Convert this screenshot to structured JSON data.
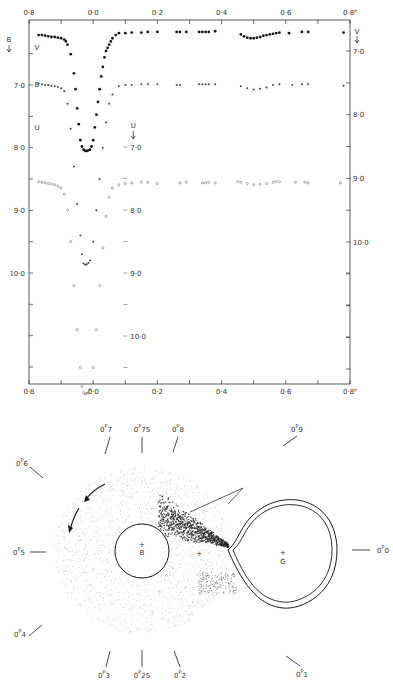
{
  "chart_data": [
    {
      "type": "scatter",
      "title": "",
      "xlabel": "Phase",
      "ylabel": "Magnitude",
      "x_ticks": [
        "0·8",
        "0·0",
        "0·2",
        "0·4",
        "0·6",
        "0·8ᴾ"
      ],
      "x_tick_values": [
        -0.2,
        0.0,
        0.2,
        0.4,
        0.6,
        0.8
      ],
      "xlim": [
        -0.2,
        0.8
      ],
      "axes": {
        "left_B": {
          "label": "B",
          "ticks": [
            "7·0",
            "8·0",
            "9·0",
            "10·0"
          ],
          "values": [
            7.0,
            8.0,
            9.0,
            10.0
          ],
          "ylim": [
            6.4,
            11.8
          ]
        },
        "right_V": {
          "label": "V",
          "ticks": [
            "7·0",
            "8·0",
            "9·0",
            "10·0"
          ],
          "values": [
            7.0,
            8.0,
            9.0,
            10.0
          ],
          "ylim": [
            6.5,
            11.8
          ]
        },
        "inner_U": {
          "label": "U",
          "ticks": [
            "7·0",
            "8·0",
            "9·0",
            "10·0"
          ],
          "values": [
            7.0,
            8.0,
            9.0,
            10.0
          ],
          "x_position": 0.1
        }
      },
      "grid": false,
      "legend": "curve labels at left: V, B, U",
      "series": [
        {
          "name": "V",
          "marker": "filled-dot",
          "x": [
            -0.17,
            -0.16,
            -0.15,
            -0.14,
            -0.13,
            -0.12,
            -0.11,
            -0.1,
            -0.09,
            -0.085,
            -0.08,
            -0.07,
            -0.06,
            -0.055,
            -0.05,
            -0.045,
            -0.04,
            -0.035,
            -0.03,
            -0.025,
            -0.02,
            -0.015,
            -0.01,
            -0.005,
            0.0,
            0.005,
            0.01,
            0.015,
            0.02,
            0.025,
            0.03,
            0.035,
            0.04,
            0.045,
            0.05,
            0.055,
            0.06,
            0.07,
            0.08,
            0.1,
            0.12,
            0.15,
            0.17,
            0.2,
            0.26,
            0.27,
            0.29,
            0.33,
            0.34,
            0.35,
            0.36,
            0.38,
            0.46,
            0.47,
            0.48,
            0.49,
            0.5,
            0.51,
            0.52,
            0.53,
            0.54,
            0.55,
            0.56,
            0.57,
            0.58,
            0.61,
            0.65,
            0.67,
            0.78
          ],
          "y": [
            6.75,
            6.75,
            6.76,
            6.77,
            6.78,
            6.78,
            6.79,
            6.8,
            6.82,
            6.85,
            6.9,
            7.05,
            7.35,
            7.6,
            7.9,
            8.15,
            8.4,
            8.5,
            8.55,
            8.57,
            8.57,
            8.56,
            8.55,
            8.5,
            8.4,
            8.2,
            8.0,
            7.8,
            7.6,
            7.4,
            7.25,
            7.1,
            7.0,
            6.95,
            6.9,
            6.85,
            6.8,
            6.75,
            6.72,
            6.72,
            6.71,
            6.71,
            6.7,
            6.7,
            6.7,
            6.7,
            6.7,
            6.7,
            6.7,
            6.7,
            6.7,
            6.69,
            6.74,
            6.77,
            6.79,
            6.8,
            6.8,
            6.79,
            6.78,
            6.76,
            6.75,
            6.74,
            6.73,
            6.72,
            6.71,
            6.72,
            6.7,
            6.7,
            6.71
          ]
        },
        {
          "name": "B",
          "marker": "small-dot",
          "x": [
            -0.17,
            -0.16,
            -0.15,
            -0.14,
            -0.13,
            -0.12,
            -0.11,
            -0.1,
            -0.09,
            -0.08,
            -0.07,
            -0.06,
            -0.05,
            -0.04,
            -0.035,
            -0.03,
            -0.025,
            -0.02,
            -0.015,
            -0.01,
            0.0,
            0.01,
            0.02,
            0.03,
            0.04,
            0.05,
            0.06,
            0.08,
            0.1,
            0.12,
            0.15,
            0.17,
            0.2,
            0.26,
            0.27,
            0.33,
            0.34,
            0.35,
            0.36,
            0.38,
            0.46,
            0.48,
            0.5,
            0.52,
            0.54,
            0.56,
            0.58,
            0.62,
            0.65,
            0.67,
            0.78
          ],
          "y": [
            6.98,
            6.99,
            7.0,
            7.0,
            7.01,
            7.02,
            7.03,
            7.05,
            7.1,
            7.3,
            7.7,
            8.3,
            8.9,
            9.4,
            9.7,
            9.85,
            9.87,
            9.86,
            9.84,
            9.8,
            9.5,
            9.0,
            8.5,
            8.0,
            7.6,
            7.3,
            7.15,
            7.02,
            7.0,
            7.0,
            6.99,
            6.99,
            6.99,
            7.0,
            7.0,
            6.99,
            6.99,
            6.99,
            6.99,
            6.99,
            7.02,
            7.05,
            7.07,
            7.06,
            7.04,
            7.0,
            6.99,
            7.0,
            6.99,
            6.99,
            7.01
          ]
        },
        {
          "name": "U",
          "marker": "open-dot",
          "x": [
            -0.17,
            -0.16,
            -0.15,
            -0.14,
            -0.13,
            -0.12,
            -0.11,
            -0.1,
            -0.09,
            -0.08,
            -0.07,
            -0.06,
            -0.05,
            -0.04,
            -0.035,
            -0.03,
            -0.025,
            -0.02,
            -0.015,
            -0.01,
            0.0,
            0.01,
            0.02,
            0.03,
            0.04,
            0.05,
            0.06,
            0.08,
            0.1,
            0.12,
            0.15,
            0.17,
            0.2,
            0.27,
            0.29,
            0.34,
            0.35,
            0.36,
            0.38,
            0.45,
            0.46,
            0.48,
            0.5,
            0.52,
            0.54,
            0.56,
            0.57,
            0.58,
            0.63,
            0.66,
            0.67,
            0.77
          ],
          "y": [
            7.55,
            7.56,
            7.57,
            7.58,
            7.59,
            7.6,
            7.62,
            7.65,
            7.75,
            8.0,
            8.5,
            9.2,
            9.9,
            10.5,
            10.8,
            10.9,
            10.92,
            10.91,
            10.9,
            10.85,
            10.5,
            9.9,
            9.2,
            8.6,
            8.1,
            7.8,
            7.65,
            7.6,
            7.58,
            7.57,
            7.56,
            7.56,
            7.58,
            7.57,
            7.56,
            7.57,
            7.57,
            7.56,
            7.57,
            7.55,
            7.56,
            7.58,
            7.6,
            7.59,
            7.58,
            7.56,
            7.55,
            7.55,
            7.56,
            7.56,
            7.57,
            7.57
          ]
        }
      ]
    },
    {
      "type": "diagram",
      "title": "",
      "description": "Schematic of binary system with accretion disk, phase markers around the orbit",
      "labels": {
        "primary": "B",
        "secondary": "G"
      },
      "phase_markers": [
        {
          "label": "0·7",
          "int": "0",
          "sup": "P",
          "frac": "7",
          "angle_deg": 112
        },
        {
          "label": "0·75",
          "int": "0",
          "sup": "P",
          "frac": "75",
          "angle_deg": 90
        },
        {
          "label": "0·8",
          "int": "0",
          "sup": "P",
          "frac": "8",
          "angle_deg": 68
        },
        {
          "label": "0·9",
          "int": "0",
          "sup": "P",
          "frac": "9",
          "angle_deg": 36
        },
        {
          "label": "0·0",
          "int": "0",
          "sup": "P",
          "frac": "0",
          "angle_deg": 0
        },
        {
          "label": "0·1",
          "int": "0",
          "sup": "P",
          "frac": "1",
          "angle_deg": -36
        },
        {
          "label": "0·2",
          "int": "0",
          "sup": "P",
          "frac": "2",
          "angle_deg": -68
        },
        {
          "label": "0·25",
          "int": "0",
          "sup": "P",
          "frac": "25",
          "angle_deg": -90
        },
        {
          "label": "0·3",
          "int": "0",
          "sup": "P",
          "frac": "3",
          "angle_deg": -112
        },
        {
          "label": "0·4",
          "int": "0",
          "sup": "P",
          "frac": "4",
          "angle_deg": -144
        },
        {
          "label": "0·5",
          "int": "0",
          "sup": "P",
          "frac": "5",
          "angle_deg": 180
        },
        {
          "label": "0·6",
          "int": "0",
          "sup": "P",
          "frac": "6",
          "angle_deg": 144
        }
      ]
    }
  ],
  "colors": {
    "ink": "#1a1a1a",
    "axis": "#333333",
    "disk_speckle": "#9a9a9a",
    "stream_dark": "#2a2a2a",
    "background": "#ffffff"
  }
}
